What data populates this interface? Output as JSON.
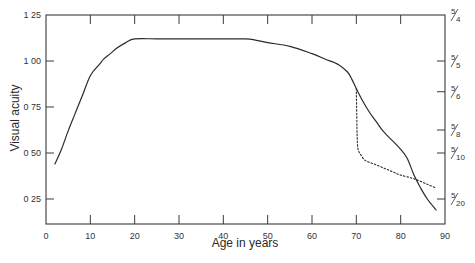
{
  "chart_data": {
    "type": "line",
    "title": "",
    "xlabel": "Age in years",
    "ylabel": "Visual acuity",
    "xlim": [
      0,
      90
    ],
    "ylim": [
      0.125,
      1.25
    ],
    "grid": false,
    "legend": null,
    "x_ticks": [
      0,
      10,
      20,
      30,
      40,
      50,
      60,
      70,
      80,
      90
    ],
    "x_tick_labels": [
      "0",
      "10",
      "20",
      "30",
      "40",
      "50",
      "60",
      "70",
      "80",
      "90"
    ],
    "y_ticks": [
      0.25,
      0.5,
      0.75,
      1.0,
      1.25
    ],
    "y_tick_labels": [
      "0 25",
      "0 50",
      "0 75",
      "1 00",
      "1 25"
    ],
    "y2_ticks": [
      {
        "value": 1.25,
        "label": "5/4",
        "num": "5",
        "den": "4"
      },
      {
        "value": 1.0,
        "label": "5/5",
        "num": "5",
        "den": "5"
      },
      {
        "value": 0.833,
        "label": "5/6",
        "num": "5",
        "den": "6"
      },
      {
        "value": 0.625,
        "label": "5/8",
        "num": "5",
        "den": "8"
      },
      {
        "value": 0.5,
        "label": "5/10",
        "num": "5",
        "den": "10"
      },
      {
        "value": 0.25,
        "label": "5/20",
        "num": "5",
        "den": "20"
      }
    ],
    "series": [
      {
        "name": "Visual acuity (solid)",
        "style": "solid",
        "x": [
          2,
          3.5,
          5,
          6.5,
          8,
          10,
          12,
          13,
          14.5,
          16,
          18,
          20,
          25,
          30,
          35,
          40,
          45,
          47,
          50,
          55,
          60,
          63,
          66,
          68,
          69,
          70,
          71.5,
          73,
          74.5,
          76,
          78,
          80,
          81.5,
          83,
          84.5,
          86,
          88
        ],
        "y": [
          0.44,
          0.52,
          0.62,
          0.71,
          0.8,
          0.92,
          0.98,
          1.01,
          1.04,
          1.07,
          1.1,
          1.12,
          1.12,
          1.12,
          1.12,
          1.12,
          1.12,
          1.115,
          1.1,
          1.08,
          1.04,
          1.01,
          0.98,
          0.94,
          0.9,
          0.85,
          0.78,
          0.72,
          0.67,
          0.62,
          0.57,
          0.52,
          0.47,
          0.38,
          0.31,
          0.25,
          0.19
        ]
      },
      {
        "name": "Visual acuity (dotted branch)",
        "style": "dotted",
        "x": [
          70,
          70.1,
          70.2,
          70.4,
          71,
          72,
          74,
          76,
          78,
          80,
          83,
          86,
          88
        ],
        "y": [
          0.85,
          0.7,
          0.58,
          0.52,
          0.49,
          0.46,
          0.44,
          0.42,
          0.4,
          0.38,
          0.36,
          0.33,
          0.31
        ]
      }
    ]
  },
  "colors": {
    "line": "#2b2b2b",
    "axis": "#3a3a3a",
    "background": "#ffffff"
  }
}
